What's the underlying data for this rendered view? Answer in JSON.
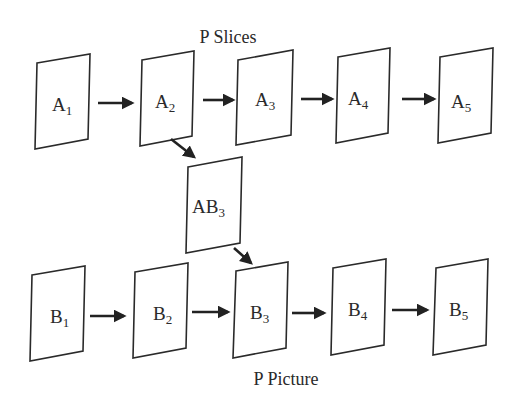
{
  "diagram": {
    "title_top": "P Slices",
    "title_bottom": "P Picture",
    "colors": {
      "stroke": "#2a2a2a",
      "arrow": "#222222",
      "background": "#ffffff"
    },
    "nodes": [
      {
        "id": "A1",
        "base": "A",
        "sub": "1",
        "row": "slices"
      },
      {
        "id": "A2",
        "base": "A",
        "sub": "2",
        "row": "slices"
      },
      {
        "id": "A3",
        "base": "A",
        "sub": "3",
        "row": "slices"
      },
      {
        "id": "A4",
        "base": "A",
        "sub": "4",
        "row": "slices"
      },
      {
        "id": "A5",
        "base": "A",
        "sub": "5",
        "row": "slices"
      },
      {
        "id": "AB3",
        "base": "AB",
        "sub": "3",
        "row": "middle"
      },
      {
        "id": "B1",
        "base": "B",
        "sub": "1",
        "row": "picture"
      },
      {
        "id": "B2",
        "base": "B",
        "sub": "2",
        "row": "picture"
      },
      {
        "id": "B3",
        "base": "B",
        "sub": "3",
        "row": "picture"
      },
      {
        "id": "B4",
        "base": "B",
        "sub": "4",
        "row": "picture"
      },
      {
        "id": "B5",
        "base": "B",
        "sub": "5",
        "row": "picture"
      }
    ],
    "edges": [
      {
        "from": "A1",
        "to": "A2"
      },
      {
        "from": "A2",
        "to": "A3"
      },
      {
        "from": "A3",
        "to": "A4"
      },
      {
        "from": "A4",
        "to": "A5"
      },
      {
        "from": "A2",
        "to": "AB3"
      },
      {
        "from": "AB3",
        "to": "B3"
      },
      {
        "from": "B1",
        "to": "B2"
      },
      {
        "from": "B2",
        "to": "B3"
      },
      {
        "from": "B3",
        "to": "B4"
      },
      {
        "from": "B4",
        "to": "B5"
      }
    ]
  }
}
